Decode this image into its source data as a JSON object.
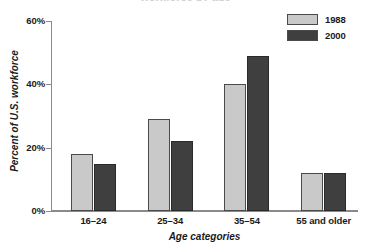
{
  "figure": {
    "clipped_title": "workforce by age",
    "y_axis_title": "Percent of U.S. workforce",
    "x_axis_title": "Age categories"
  },
  "legend": {
    "position": "top-right",
    "entries": [
      {
        "label": "1988",
        "color": "#c9c9c9"
      },
      {
        "label": "2000",
        "color": "#3f3f3f"
      }
    ]
  },
  "axis": {
    "y_ticks": [
      "0%",
      "20%",
      "40%",
      "60%"
    ],
    "x_ticks": [
      "16–24",
      "25–34",
      "35–54",
      "55 and older"
    ]
  },
  "chart_data": {
    "type": "bar",
    "title": "",
    "xlabel": "Age categories",
    "ylabel": "Percent of U.S. workforce",
    "categories": [
      "16–24",
      "25–34",
      "35–54",
      "55 and older"
    ],
    "series": [
      {
        "name": "1988",
        "color": "#c9c9c9",
        "values": [
          18,
          29,
          40,
          12
        ]
      },
      {
        "name": "2000",
        "color": "#3f3f3f",
        "values": [
          15,
          22,
          49,
          12
        ]
      }
    ],
    "ylim": [
      0,
      60
    ],
    "ytick_values": [
      0,
      20,
      40,
      60
    ],
    "ytick_labels": [
      "0%",
      "20%",
      "40%",
      "60%"
    ],
    "grid": false,
    "legend_position": "top-right",
    "value_unit": "percent"
  }
}
